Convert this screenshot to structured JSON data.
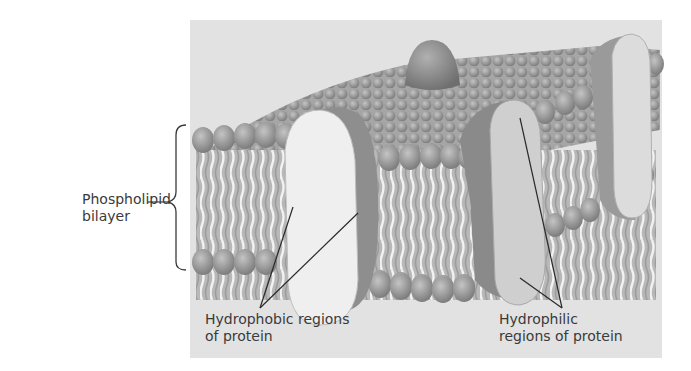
{
  "diagram": {
    "type": "membrane-protein-illustration",
    "labels": {
      "bilayer": {
        "line1": "Phospholipid",
        "line2": "bilayer"
      },
      "hydrophobic": {
        "line1": "Hydrophobic regions",
        "line2": "of protein"
      },
      "hydrophilic": {
        "line1": "Hydrophilic",
        "line2": "regions of protein"
      }
    },
    "colors": {
      "panel": "#e2e2e2",
      "head": "#8f8f8f",
      "tail": "#c9c9c9",
      "protein_light": "#eeeeee",
      "protein_dark": "#9a9a9a",
      "leader_line": "#2a2a2a"
    }
  }
}
